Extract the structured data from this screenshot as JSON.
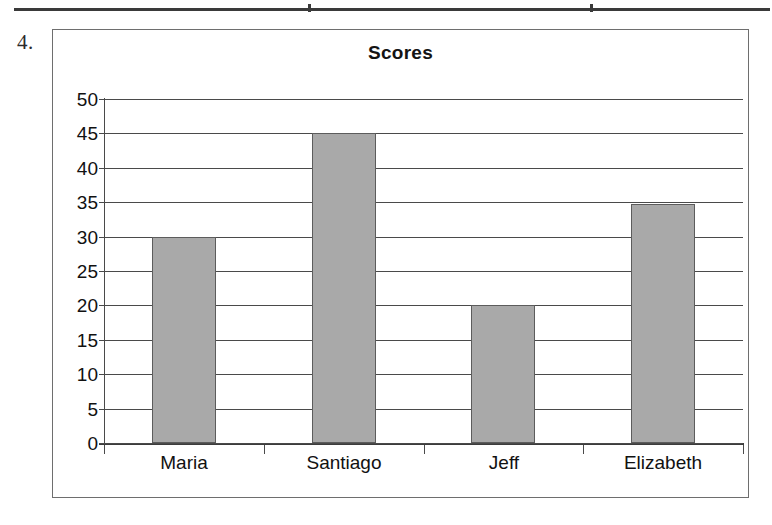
{
  "page": {
    "question_number": "4."
  },
  "table_fragment": {
    "name": "table-bottom-edge",
    "column_divider_x": [
      310,
      592
    ]
  },
  "chart_data": {
    "type": "bar",
    "title": "Scores",
    "xlabel": "",
    "ylabel": "",
    "categories": [
      "Maria",
      "Santiago",
      "Jeff",
      "Elizabeth"
    ],
    "values": [
      30,
      45,
      20,
      34.7
    ],
    "ylim": [
      0,
      50
    ],
    "y_ticks": [
      50,
      45,
      40,
      35,
      30,
      25,
      20,
      15,
      10,
      5,
      0
    ],
    "y_tick_labels": [
      "50",
      "45",
      "40",
      "35",
      "30",
      "25",
      "20",
      "15",
      "10",
      "5",
      "0"
    ],
    "grid": true,
    "legend": false,
    "legend_position": "none",
    "bar_fill_color": "#a9a9a9",
    "bar_border_color": "#5c5c5c",
    "axis_color": "#4a4a4a",
    "title_color": "#141414",
    "background_color": "#ffffff",
    "series": [
      {
        "name": "Scores",
        "values": [
          30,
          45,
          20,
          34.7
        ]
      }
    ]
  }
}
